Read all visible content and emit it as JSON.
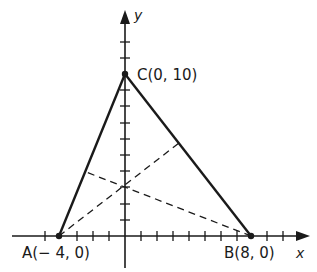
{
  "diagram": {
    "title": "",
    "axes": {
      "x_label": "x",
      "y_label": "y",
      "x_ticks_from": -5,
      "x_ticks_to": 10,
      "y_ticks_to": 12
    },
    "points": [
      {
        "name": "A",
        "label": "A(− 4, 0)",
        "x": -4,
        "y": 0
      },
      {
        "name": "B",
        "label": "B(8, 0)",
        "x": 8,
        "y": 0
      },
      {
        "name": "C",
        "label": "C(0, 10)",
        "x": 0,
        "y": 10
      }
    ],
    "triangle": [
      "A",
      "B",
      "C"
    ],
    "altitudes": [
      {
        "from": "A",
        "to_side": "BC",
        "foot": [
          3.12,
          6.1
        ],
        "style": "dashed"
      },
      {
        "from": "B",
        "to_side": "AC",
        "foot": [
          -2.34,
          4.14
        ],
        "style": "dashed"
      }
    ],
    "orthocenter": [
      0,
      3.2
    ],
    "colors": {
      "line": "#1a1a1a",
      "background": "#ffffff"
    }
  }
}
